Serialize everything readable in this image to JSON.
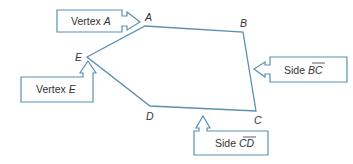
{
  "diagram": {
    "type": "pentagon-callouts",
    "stroke_color": "#5b8fb0",
    "text_color": "#333333",
    "vertices": [
      {
        "id": "A",
        "label": "A",
        "x": 145,
        "y": 26,
        "lx": 147,
        "ly": 20
      },
      {
        "id": "B",
        "label": "B",
        "x": 243,
        "y": 32,
        "lx": 241,
        "ly": 26
      },
      {
        "id": "C",
        "label": "C",
        "x": 256,
        "y": 111,
        "lx": 255,
        "ly": 124
      },
      {
        "id": "D",
        "label": "D",
        "x": 150,
        "y": 106,
        "lx": 146,
        "ly": 119
      },
      {
        "id": "E",
        "label": "E",
        "x": 87,
        "y": 57,
        "lx": 76,
        "ly": 60
      }
    ],
    "callouts": {
      "vertex_a": {
        "prefix": "Vertex ",
        "italic": "A"
      },
      "vertex_e": {
        "prefix": "Vertex ",
        "italic": "E"
      },
      "side_bc": {
        "prefix": "Side ",
        "italic": "BC",
        "overline": true
      },
      "side_cd": {
        "prefix": "Side ",
        "italic": "CD",
        "overline": true
      }
    }
  }
}
